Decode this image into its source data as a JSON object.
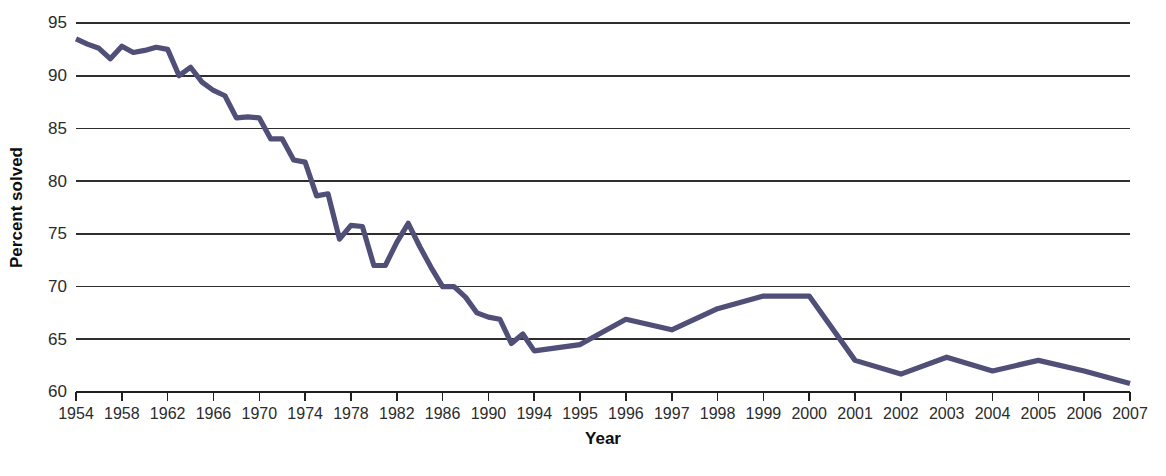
{
  "chart_data": {
    "type": "line",
    "title": "",
    "subtitle": "",
    "xlabel": "Year",
    "ylabel": "Percent solved",
    "xlim": [
      1954,
      2007
    ],
    "ylim": [
      60,
      95
    ],
    "grid": true,
    "legend": false,
    "legend_position": "none",
    "line_color": "#4f4f77",
    "y_ticks": [
      95,
      90,
      85,
      80,
      75,
      70,
      65,
      60
    ],
    "y_tick_labels": [
      "95",
      "90",
      "85",
      "80",
      "75",
      "70",
      "65",
      "60"
    ],
    "x_tick_labels": [
      "1954",
      "1958",
      "1962",
      "1966",
      "1970",
      "1974",
      "1978",
      "1982",
      "1986",
      "1990",
      "1994",
      "1995",
      "1996",
      "1997",
      "1998",
      "1999",
      "2000",
      "2001",
      "2002",
      "2003",
      "2004",
      "2005",
      "2006",
      "2007"
    ],
    "x_axis_note": "Tick labels are spaced evenly: every 4th year from 1954 through 1994, then every year from 1995 through 2007",
    "x": [
      1954,
      1955,
      1956,
      1957,
      1958,
      1959,
      1960,
      1961,
      1962,
      1963,
      1964,
      1965,
      1966,
      1967,
      1968,
      1969,
      1970,
      1971,
      1972,
      1973,
      1974,
      1975,
      1976,
      1977,
      1978,
      1979,
      1980,
      1981,
      1982,
      1983,
      1984,
      1985,
      1986,
      1987,
      1988,
      1989,
      1990,
      1991,
      1992,
      1993,
      1994,
      1995,
      1996,
      1997,
      1998,
      1999,
      2000,
      2001,
      2002,
      2003,
      2004,
      2005,
      2006,
      2007
    ],
    "values": [
      93.5,
      93.0,
      92.6,
      91.6,
      92.8,
      92.2,
      92.4,
      92.7,
      92.5,
      90.0,
      90.8,
      89.4,
      88.6,
      88.1,
      86.0,
      86.1,
      86.0,
      84.0,
      84.0,
      82.0,
      81.8,
      78.6,
      78.8,
      74.5,
      75.8,
      75.7,
      72.0,
      72.0,
      74.2,
      76.0,
      73.8,
      71.8,
      70.0,
      70.0,
      69.0,
      67.5,
      67.1,
      66.9,
      64.6,
      65.5,
      63.9,
      64.5,
      66.9,
      65.9,
      67.9,
      69.1,
      69.1,
      63.0,
      61.7,
      63.3,
      62.0,
      63.0,
      62.0,
      60.8
    ],
    "series": [
      {
        "name": "Percent solved",
        "values": [
          93.5,
          93.0,
          92.6,
          91.6,
          92.8,
          92.2,
          92.4,
          92.7,
          92.5,
          90.0,
          90.8,
          89.4,
          88.6,
          88.1,
          86.0,
          86.1,
          86.0,
          84.0,
          84.0,
          82.0,
          81.8,
          78.6,
          78.8,
          74.5,
          75.8,
          75.7,
          72.0,
          72.0,
          74.2,
          76.0,
          73.8,
          71.8,
          70.0,
          70.0,
          69.0,
          67.5,
          67.1,
          66.9,
          64.6,
          65.5,
          63.9,
          64.5,
          66.9,
          65.9,
          67.9,
          69.1,
          69.1,
          63.0,
          61.7,
          63.3,
          62.0,
          63.0,
          62.0,
          60.8
        ]
      }
    ],
    "annotations": []
  }
}
